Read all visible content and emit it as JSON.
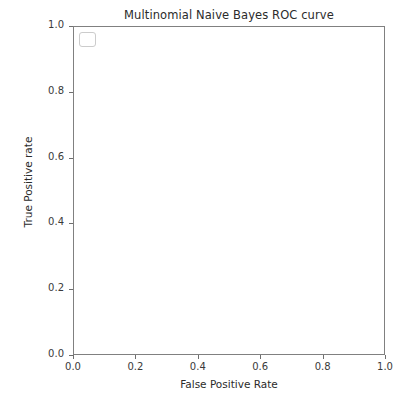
{
  "chart_data": {
    "type": "line",
    "title": "Multinomial Naive Bayes ROC curve",
    "xlabel": "False Positive Rate",
    "ylabel": "True Positive rate",
    "xlim": [
      0.0,
      1.0
    ],
    "ylim": [
      0.0,
      1.0
    ],
    "xticks": [
      "0.0",
      "0.2",
      "0.4",
      "0.6",
      "0.8",
      "1.0"
    ],
    "xtick_values": [
      0.0,
      0.2,
      0.4,
      0.6,
      0.8,
      1.0
    ],
    "yticks": [
      "0.0",
      "0.2",
      "0.4",
      "0.6",
      "0.8",
      "1.0"
    ],
    "ytick_values": [
      0.0,
      0.2,
      0.4,
      0.6,
      0.8,
      1.0
    ],
    "grid": false,
    "legend_position": "upper left",
    "legend_entries": [],
    "series": [
      {
        "name": "ROC curve",
        "style": "solid",
        "color": "#808080",
        "x": [
          0.0,
          0.003,
          0.006,
          0.008,
          0.01,
          0.012,
          0.015,
          0.02,
          0.026,
          0.032,
          0.038,
          0.045,
          0.052,
          0.06,
          0.068,
          0.076,
          0.084,
          0.092,
          0.1,
          0.108,
          0.116,
          0.124,
          0.132,
          0.141,
          0.15,
          0.16,
          0.172,
          0.186,
          0.2,
          0.216,
          0.234,
          0.254,
          0.276,
          0.3,
          0.33,
          0.37,
          0.42,
          0.48,
          0.55,
          0.63,
          0.72,
          0.82,
          0.91,
          1.0
        ],
        "y": [
          0.0,
          0.12,
          0.225,
          0.28,
          0.32,
          0.332,
          0.34,
          0.358,
          0.382,
          0.408,
          0.435,
          0.468,
          0.5,
          0.54,
          0.578,
          0.608,
          0.63,
          0.668,
          0.7,
          0.712,
          0.74,
          0.775,
          0.805,
          0.832,
          0.858,
          0.88,
          0.9,
          0.92,
          0.938,
          0.95,
          0.958,
          0.963,
          0.966,
          0.968,
          0.97,
          0.972,
          0.974,
          0.977,
          0.979,
          0.982,
          0.985,
          0.989,
          0.993,
          1.0
        ]
      },
      {
        "name": "chance-diagonal",
        "style": "dashed",
        "color": "#4d4d4d",
        "x": [
          0.0,
          1.0
        ],
        "y": [
          0.0,
          1.0
        ]
      }
    ]
  }
}
